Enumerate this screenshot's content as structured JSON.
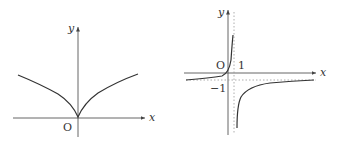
{
  "figures": [
    {
      "id": "left",
      "description": "cusp curve symmetric about y-axis, y = |x|^(1/2) shape",
      "x_axis_label": "x",
      "y_axis_label": "y",
      "origin_label": "O"
    },
    {
      "id": "right",
      "description": "hyperbola-like curve with vertical asymptote x=1 and horizontal asymptote y=-1, passing through origin",
      "x_axis_label": "x",
      "y_axis_label": "y",
      "origin_label": "O",
      "vertical_asymptote_label": "1",
      "horizontal_asymptote_label": "−1"
    }
  ],
  "colors": {
    "axis": "#555555",
    "curve": "#333333",
    "dash": "#999999"
  }
}
